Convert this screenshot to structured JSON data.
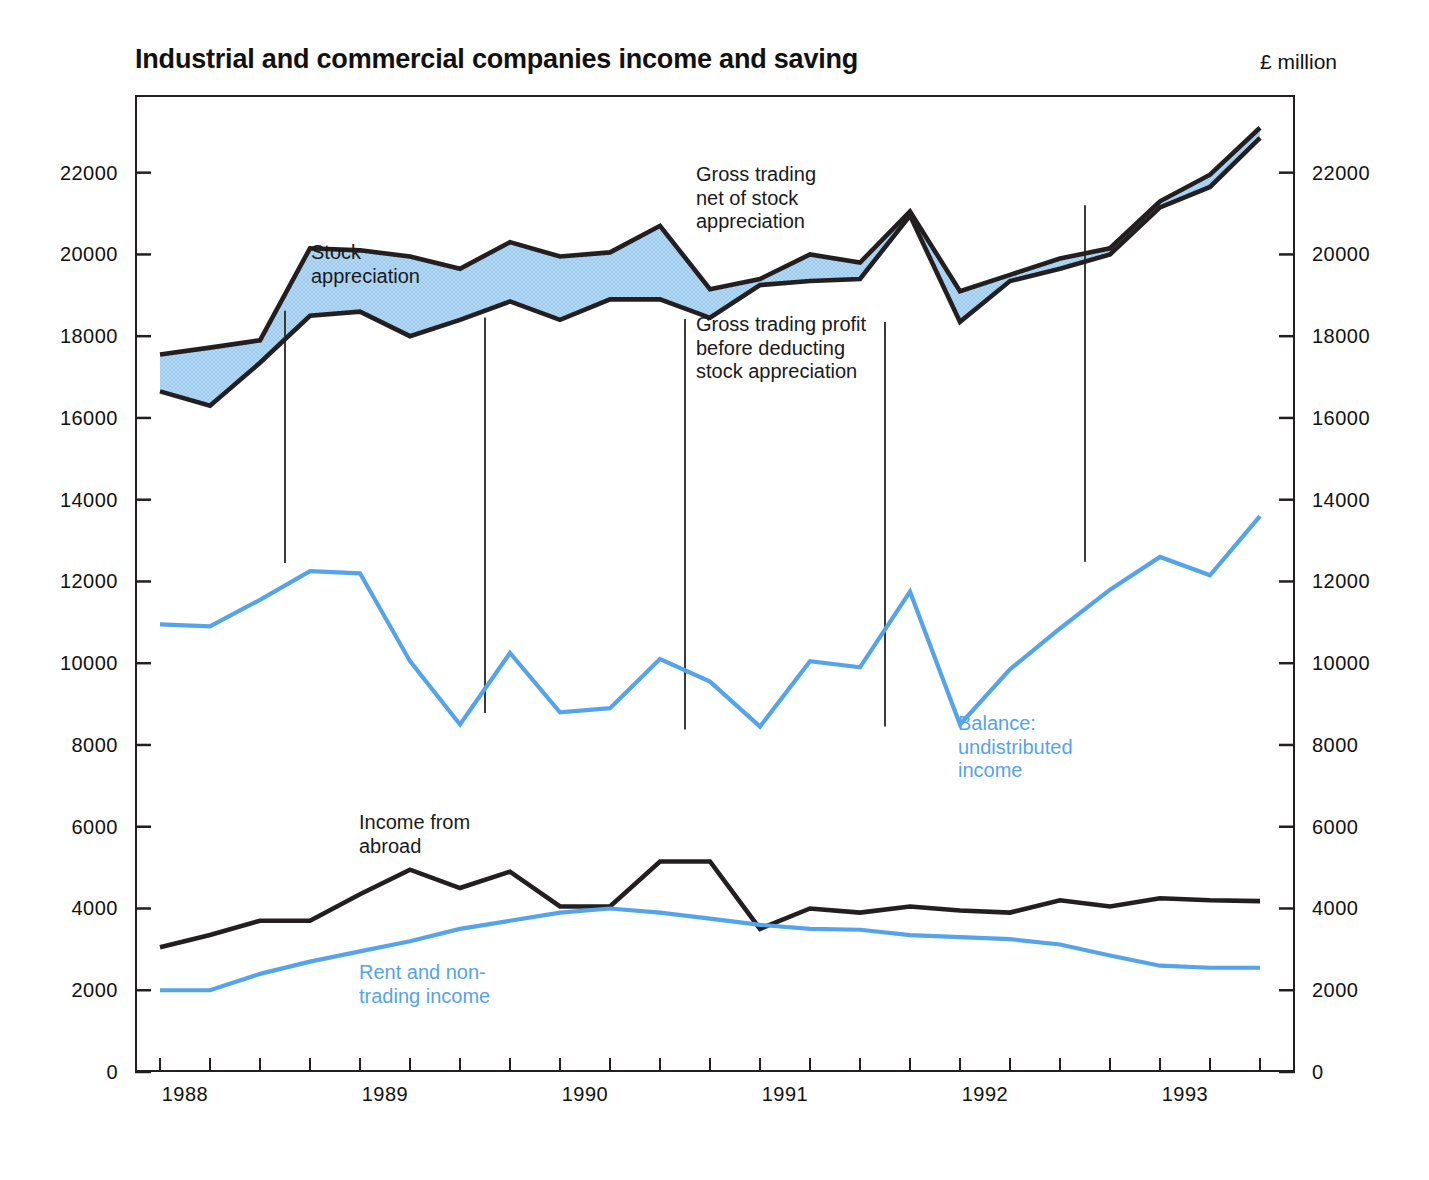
{
  "header": {
    "title": "Industrial and commercial companies income and saving",
    "unit_label": "£ million"
  },
  "annotations": {
    "stock_appreciation": "Stock\nappreciation",
    "gross_trading_net": "Gross trading\nnet of stock\nappreciation",
    "gross_trading_profit": "Gross trading profit\nbefore deducting\nstock appreciation",
    "balance_undistributed": "Balance:\nundistributed\nincome",
    "income_from_abroad": "Income from\nabroad",
    "rent_non_trading": "Rent and non-\ntrading income"
  },
  "colors": {
    "line_black": "#231f20",
    "line_blue": "#55a3e8",
    "band_fill": "#a8d2f0",
    "frame": "#231f20"
  },
  "axis": {
    "y_ticks": [
      0,
      2000,
      4000,
      6000,
      8000,
      10000,
      12000,
      14000,
      16000,
      18000,
      20000,
      22000
    ],
    "y_tick_labels": [
      "0",
      "2000",
      "4000",
      "6000",
      "8000",
      "10000",
      "12000",
      "14000",
      "16000",
      "18000",
      "20000",
      "22000"
    ],
    "y_min": 0,
    "y_max": 23900,
    "x_year_labels": [
      "1988",
      "1989",
      "1990",
      "1991",
      "1992",
      "1993"
    ],
    "x_min": 1987.75,
    "x_max": 1993.55,
    "x_year_divider_years": [
      1988.5,
      1989.5,
      1990.5,
      1991.5,
      1992.5
    ]
  },
  "chart_data": {
    "type": "line",
    "title": "Industrial and commercial companies income and saving",
    "subtitle": "",
    "xlabel": "",
    "ylabel": "£ million",
    "ylim": [
      0,
      23900
    ],
    "grid": false,
    "legend": "in-plot annotations",
    "x": [
      1987.875,
      1988.125,
      1988.375,
      1988.625,
      1988.875,
      1989.125,
      1989.375,
      1989.625,
      1989.875,
      1990.125,
      1990.375,
      1990.625,
      1990.875,
      1991.125,
      1991.375,
      1991.625,
      1991.875,
      1992.125,
      1992.375,
      1992.625,
      1992.875,
      1993.125,
      1993.375
    ],
    "x_labels": [
      "1988 Q1",
      "1988 Q2",
      "1988 Q3",
      "1988 Q4",
      "1989 Q1",
      "1989 Q2",
      "1989 Q3",
      "1989 Q4",
      "1990 Q1",
      "1990 Q2",
      "1990 Q3",
      "1990 Q4",
      "1991 Q1",
      "1991 Q2",
      "1991 Q3",
      "1991 Q4",
      "1992 Q1",
      "1992 Q2",
      "1992 Q3",
      "1992 Q4",
      "1993 Q1",
      "1993 Q2",
      "1993 Q3"
    ],
    "series": [
      {
        "name": "Gross trading profit before deducting stock appreciation",
        "color": "#231f20",
        "values": [
          17550,
          17720,
          17900,
          20150,
          20100,
          19950,
          19650,
          20300,
          19950,
          20050,
          20700,
          19150,
          19400,
          20000,
          19800,
          21050,
          19100,
          19500,
          19900,
          20150,
          21300,
          21950,
          23100
        ]
      },
      {
        "name": "Gross trading net of stock appreciation",
        "color": "#231f20",
        "values": [
          16650,
          16300,
          17350,
          18500,
          18600,
          18000,
          18400,
          18850,
          18400,
          18900,
          18900,
          18450,
          19250,
          19350,
          19400,
          20950,
          18350,
          19350,
          19650,
          20000,
          21150,
          21650,
          22850
        ]
      },
      {
        "name": "Balance: undistributed income",
        "color": "#55a3e8",
        "values": [
          10950,
          10900,
          11550,
          12250,
          12200,
          10050,
          8500,
          10250,
          8800,
          8900,
          10100,
          9550,
          8450,
          10050,
          9900,
          11750,
          8500,
          9850,
          10850,
          11800,
          12600,
          12150,
          13600
        ]
      },
      {
        "name": "Income from abroad",
        "color": "#231f20",
        "values": [
          3050,
          3350,
          3700,
          3700,
          4350,
          4950,
          4500,
          4900,
          4050,
          4050,
          5150,
          5150,
          3500,
          4000,
          3900,
          4050,
          3950,
          3900,
          4200,
          4050,
          4250,
          4200,
          4180
        ]
      },
      {
        "name": "Rent and non-trading income",
        "color": "#55a3e8",
        "values": [
          2000,
          2000,
          2400,
          2700,
          2950,
          3200,
          3500,
          3700,
          3900,
          4000,
          3900,
          3750,
          3600,
          3500,
          3480,
          3350,
          3300,
          3250,
          3120,
          2850,
          2600,
          2550,
          2550
        ]
      }
    ]
  }
}
